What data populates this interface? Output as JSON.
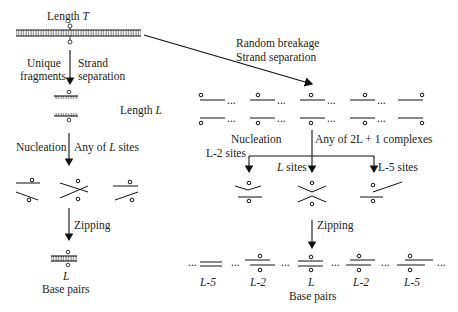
{
  "left": {
    "top_label_prefix": "Length ",
    "top_label_var": "T",
    "step1_left": [
      "Unique",
      "fragments"
    ],
    "step1_right": [
      "Strand",
      "separation"
    ],
    "length_label_prefix": "Length ",
    "length_label_var": "L",
    "step2_left": "Nucleation",
    "step2_right_prefix": "Any of ",
    "step2_right_var": "L",
    "step2_right_suffix": " sites",
    "step3": "Zipping",
    "result_var": "L",
    "result_label": "Base pairs"
  },
  "right": {
    "diag_label": [
      "Random breakage",
      "Strand separation"
    ],
    "step2_left": "Nucleation",
    "step2_right": "Any of  2L + 1  complexes",
    "branch_left": "L-2 sites",
    "branch_mid_var": "L",
    "branch_mid_suffix": " sites",
    "branch_right": "L-5 sites",
    "step3": "Zipping",
    "dots": "...",
    "results": [
      "L-5",
      "L-2",
      "L",
      "L-2",
      "L-5"
    ],
    "result_label": "Base pairs"
  }
}
